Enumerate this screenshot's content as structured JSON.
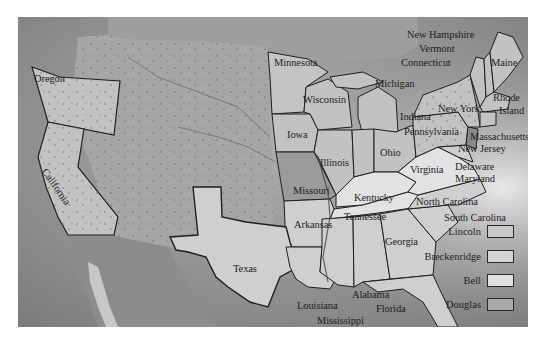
{
  "map": {
    "title": "",
    "states": {
      "oregon": "Oregon",
      "california": "California",
      "minnesota": "Minnesota",
      "wisconsin": "Wisconsin",
      "michigan": "Michigan",
      "iowa": "Iowa",
      "illinois": "Illinois",
      "indiana": "Indiana",
      "ohio": "Ohio",
      "missouri": "Missouri",
      "kentucky": "Kentucky",
      "tennessee": "Tennessee",
      "arkansas": "Arkansas",
      "texas": "Texas",
      "louisiana": "Louisiana",
      "mississippi": "Mississippi",
      "alabama": "Alabama",
      "georgia": "Georgia",
      "florida": "Florida",
      "south_carolina": "South Carolina",
      "north_carolina": "North Carolina",
      "virginia": "Virginia",
      "maryland": "Maryland",
      "delaware": "Delaware",
      "new_jersey": "New Jersey",
      "pennsylvania": "Pennsylvania",
      "new_york": "New York",
      "massachusetts": "Massachusetts",
      "rhode_island_1": "Rhode",
      "rhode_island_2": "Island",
      "connecticut": "Connecticut",
      "vermont": "Vermont",
      "new_hampshire": "New Hampshire",
      "maine": "Maine"
    }
  },
  "legend": {
    "items": [
      {
        "label": "Lincoln",
        "color": "#c9c9c9"
      },
      {
        "label": "Breckenridge",
        "color": "#d4d4d4"
      },
      {
        "label": "Bell",
        "color": "#e0e0e0"
      },
      {
        "label": "Douglas",
        "color": "#a9a9a9"
      }
    ]
  },
  "colors": {
    "ocean": "#8f8f8f",
    "territory": "#a4a4a4",
    "lincoln": "#c2c2c2",
    "breckenridge": "#cfcfcf",
    "bell": "#e2e2e2",
    "douglas": "#9a9a9a",
    "border": "#1f1f1f"
  }
}
